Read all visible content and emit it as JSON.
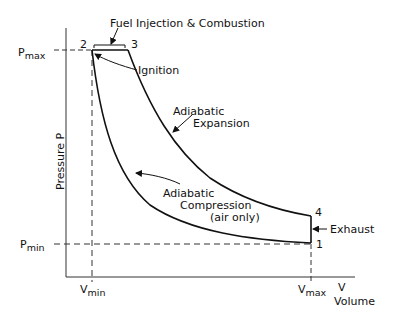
{
  "diagram": {
    "axes": {
      "y_label": "Pressure P",
      "x_label_symbol": "V",
      "x_label": "Volume",
      "p_max": {
        "main": "P",
        "sub": "max"
      },
      "p_min": {
        "main": "P",
        "sub": "min"
      },
      "v_min": {
        "main": "V",
        "sub": "min"
      },
      "v_max": {
        "main": "V",
        "sub": "max"
      }
    },
    "points": {
      "p1": "1",
      "p2": "2",
      "p3": "3",
      "p4": "4"
    },
    "annotations": {
      "fuel": "Fuel Injection & Combustion",
      "ignition": "Ignition",
      "expansion_1": "Adiabatic",
      "expansion_2": "Expansion",
      "compression_1": "Adiabatic",
      "compression_2": "Compression",
      "compression_3": "(air only)",
      "exhaust": "Exhaust"
    },
    "colors": {
      "line": "#111111",
      "background": "#ffffff"
    }
  }
}
